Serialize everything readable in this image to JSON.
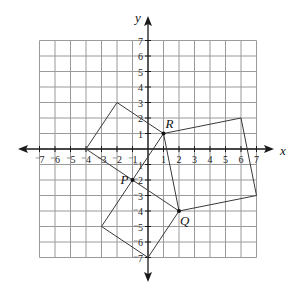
{
  "diagram": {
    "type": "coordinate-grid",
    "x_range": [
      -7,
      7
    ],
    "y_range": [
      -7,
      7
    ],
    "x_axis_label": "x",
    "y_axis_label": "y",
    "x_ticks": [
      -7,
      -6,
      -5,
      -4,
      -3,
      -2,
      -1,
      1,
      2,
      3,
      4,
      5,
      6,
      7
    ],
    "y_ticks": [
      -7,
      -6,
      -5,
      -4,
      -3,
      -2,
      -1,
      1,
      2,
      3,
      4,
      5,
      6,
      7
    ],
    "points": [
      {
        "label": "P",
        "x": -1,
        "y": -2
      },
      {
        "label": "Q",
        "x": 2,
        "y": -4
      },
      {
        "label": "R",
        "x": 1,
        "y": 1
      }
    ],
    "polygons": [
      {
        "name": "square-on-PR",
        "vertices": [
          [
            -4,
            0
          ],
          [
            -2,
            3
          ],
          [
            1,
            1
          ],
          [
            -1,
            -2
          ]
        ]
      },
      {
        "name": "square-on-PQ",
        "vertices": [
          [
            -1,
            -2
          ],
          [
            2,
            -4
          ],
          [
            0,
            -7
          ],
          [
            -3,
            -5
          ]
        ]
      },
      {
        "name": "square-on-QR",
        "vertices": [
          [
            1,
            1
          ],
          [
            6,
            2
          ],
          [
            7,
            -3
          ],
          [
            2,
            -4
          ]
        ]
      }
    ],
    "colors": {
      "grid": "#9a9a9a",
      "axis": "#1a1a1a",
      "shape": "#3a3a3a"
    }
  }
}
